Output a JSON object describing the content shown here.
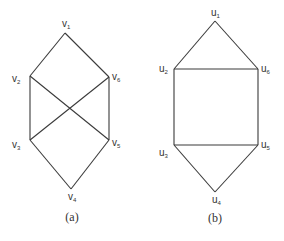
{
  "graphs": [
    {
      "id": "a",
      "caption": "(a)",
      "caption_pos": [
        72,
        221
      ],
      "vertices": [
        {
          "name": "v",
          "sub": "1",
          "x": 65,
          "y": 33,
          "lx": 62,
          "ly": 27
        },
        {
          "name": "v",
          "sub": "2",
          "x": 30,
          "y": 76,
          "lx": 12,
          "ly": 82
        },
        {
          "name": "v",
          "sub": "6",
          "x": 109,
          "y": 77,
          "lx": 112,
          "ly": 80
        },
        {
          "name": "v",
          "sub": "3",
          "x": 30,
          "y": 140,
          "lx": 12,
          "ly": 148
        },
        {
          "name": "v",
          "sub": "5",
          "x": 109,
          "y": 140,
          "lx": 112,
          "ly": 146
        },
        {
          "name": "v",
          "sub": "4",
          "x": 71,
          "y": 189,
          "lx": 68,
          "ly": 200
        }
      ],
      "edges": [
        [
          0,
          1
        ],
        [
          0,
          2
        ],
        [
          1,
          3
        ],
        [
          2,
          4
        ],
        [
          1,
          4
        ],
        [
          2,
          3
        ],
        [
          3,
          5
        ],
        [
          4,
          5
        ]
      ]
    },
    {
      "id": "b",
      "caption": "(b)",
      "caption_pos": [
        215,
        222
      ],
      "vertices": [
        {
          "name": "u",
          "sub": "1",
          "x": 215,
          "y": 21,
          "lx": 211,
          "ly": 16
        },
        {
          "name": "u",
          "sub": "2",
          "x": 174,
          "y": 69,
          "lx": 159,
          "ly": 72
        },
        {
          "name": "u",
          "sub": "6",
          "x": 258,
          "y": 69,
          "lx": 261,
          "ly": 72
        },
        {
          "name": "u",
          "sub": "3",
          "x": 174,
          "y": 145,
          "lx": 159,
          "ly": 156
        },
        {
          "name": "u",
          "sub": "5",
          "x": 258,
          "y": 145,
          "lx": 261,
          "ly": 148
        },
        {
          "name": "u",
          "sub": "4",
          "x": 215,
          "y": 192,
          "lx": 212,
          "ly": 203
        }
      ],
      "edges": [
        [
          0,
          1
        ],
        [
          0,
          2
        ],
        [
          1,
          2
        ],
        [
          1,
          3
        ],
        [
          2,
          4
        ],
        [
          3,
          4
        ],
        [
          3,
          5
        ],
        [
          4,
          5
        ]
      ]
    }
  ],
  "colors": {
    "line": "#3a3a3a",
    "text": "#333333",
    "background": "#ffffff"
  }
}
